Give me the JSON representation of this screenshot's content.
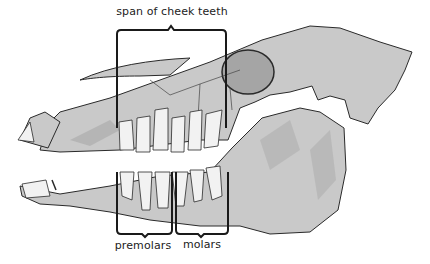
{
  "diagram": {
    "labels": {
      "span": "span of cheek teeth",
      "premolars": "premolars",
      "molars": "molars"
    },
    "colors": {
      "bone": "#c9c9c9",
      "bone_dark": "#a9a9a9",
      "outline": "#2a2a2a",
      "tooth": "#f2f2f2",
      "bracket": "#1a1a1a",
      "background": "#ffffff"
    }
  }
}
